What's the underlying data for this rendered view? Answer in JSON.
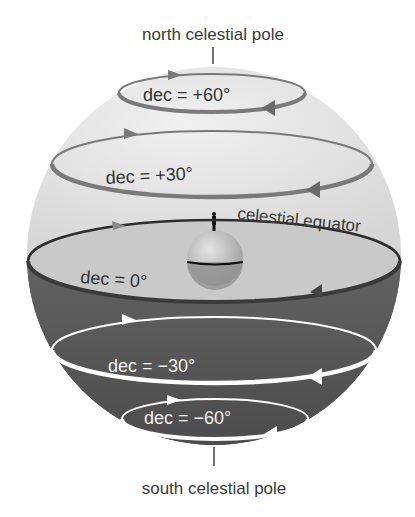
{
  "diagram": {
    "type": "celestial-sphere",
    "labels": {
      "north_pole": "north celestial pole",
      "south_pole": "south celestial pole",
      "equator": "celestial equator"
    },
    "declination_circles": [
      {
        "id": "plus60",
        "label": "dec = +60°"
      },
      {
        "id": "plus30",
        "label": "dec = +30°"
      },
      {
        "id": "zero",
        "label": "dec = 0°"
      },
      {
        "id": "minus30",
        "label": "dec = −30°"
      },
      {
        "id": "minus60",
        "label": "dec = −60°"
      }
    ],
    "colors": {
      "upper_hemisphere": "#e4e4e4",
      "lower_hemisphere": "#555555",
      "equator_plane": "#c9c9c9",
      "upper_ring": "#7a7a7a",
      "lower_ring": "#ffffff",
      "earth": "#bdbdbd"
    }
  }
}
